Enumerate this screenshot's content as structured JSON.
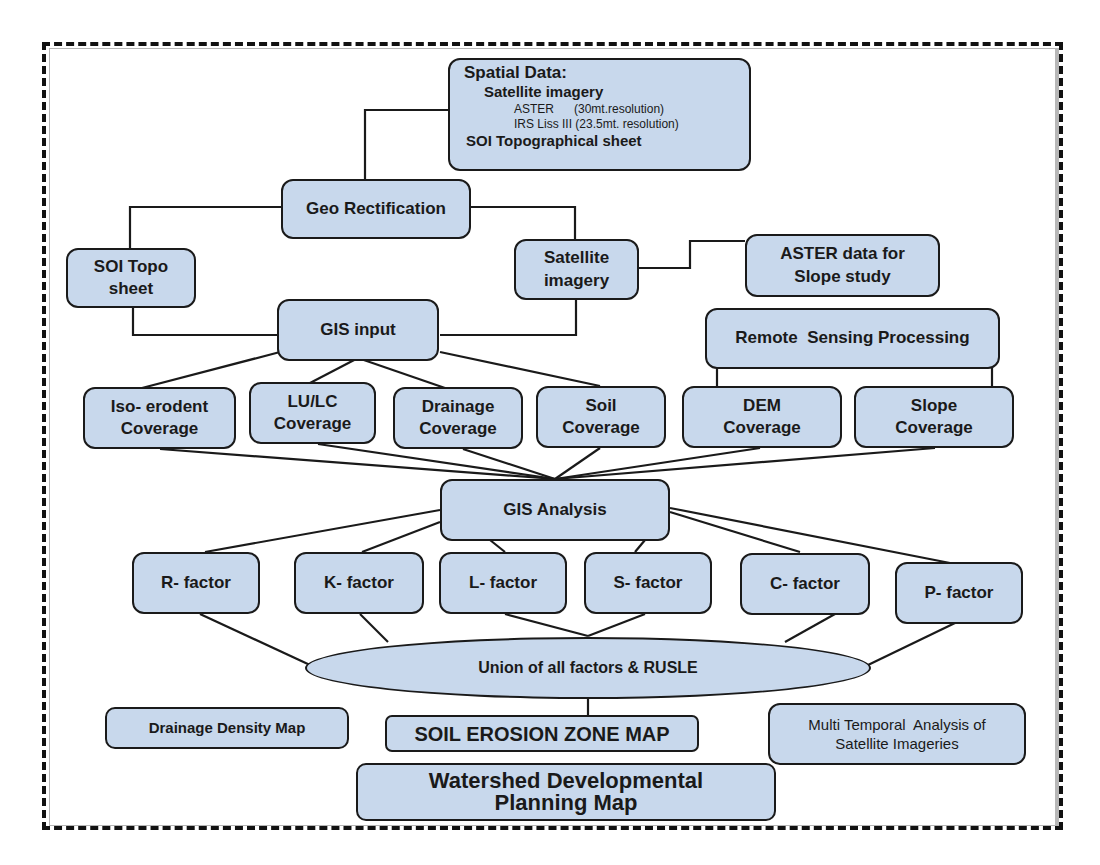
{
  "colors": {
    "box_fill": "#c8d8ec",
    "box_stroke": "#1a1a1a",
    "connector": "#1a1a1a",
    "frame_dash": "#111111"
  },
  "nodes": {
    "spatial_data": {
      "title": "Spatial Data:",
      "subtitle": "Satellite imagery",
      "aster": "ASTER      (30mt.resolution)",
      "irs": "IRS Liss III (23.5mt. resolution)",
      "soi": "SOI Topographical sheet"
    },
    "geo_rectification": {
      "label": "Geo Rectification"
    },
    "soi_topo_sheet": {
      "line1": "SOI Topo",
      "line2": "sheet"
    },
    "satellite_imagery": {
      "line1": "Satellite",
      "line2": "imagery"
    },
    "aster_slope": {
      "line1": "ASTER data for",
      "line2": "Slope study"
    },
    "gis_input": {
      "label": "GIS input"
    },
    "remote_sensing": {
      "label": "Remote  Sensing Processing"
    },
    "coverages": [
      {
        "line1": "Iso- erodent",
        "line2": "Coverage"
      },
      {
        "line1": "LU/LC",
        "line2": "Coverage"
      },
      {
        "line1": "Drainage",
        "line2": "Coverage"
      },
      {
        "line1": "Soil",
        "line2": "Coverage"
      },
      {
        "line1": "DEM",
        "line2": "Coverage"
      },
      {
        "line1": "Slope",
        "line2": "Coverage"
      }
    ],
    "gis_analysis": {
      "label": "GIS Analysis"
    },
    "factors": [
      {
        "label": "R- factor"
      },
      {
        "label": "K- factor"
      },
      {
        "label": "L- factor"
      },
      {
        "label": "S- factor"
      },
      {
        "label": "C- factor"
      },
      {
        "label": "P- factor"
      }
    ],
    "union": {
      "label": "Union of all factors & RUSLE"
    },
    "drainage_density": {
      "label": "Drainage Density Map"
    },
    "soil_erosion": {
      "label": "SOIL EROSION ZONE MAP"
    },
    "multi_temporal": {
      "line1": "Multi Temporal  Analysis of",
      "line2": "Satellite Imageries"
    },
    "watershed": {
      "line1": "Watershed Developmental",
      "line2": "Planning Map"
    }
  },
  "edges": [
    [
      "spatial_data",
      "geo_rectification"
    ],
    [
      "geo_rectification",
      "soi_topo_sheet"
    ],
    [
      "geo_rectification",
      "satellite_imagery"
    ],
    [
      "satellite_imagery",
      "aster_slope"
    ],
    [
      "soi_topo_sheet",
      "gis_input"
    ],
    [
      "satellite_imagery",
      "gis_input"
    ],
    [
      "gis_input",
      "iso_erodent_coverage"
    ],
    [
      "gis_input",
      "lulc_coverage"
    ],
    [
      "gis_input",
      "drainage_coverage"
    ],
    [
      "gis_input",
      "soil_coverage"
    ],
    [
      "remote_sensing",
      "dem_coverage"
    ],
    [
      "remote_sensing",
      "slope_coverage"
    ],
    [
      "all_coverages",
      "gis_analysis"
    ],
    [
      "gis_analysis",
      "all_factors"
    ],
    [
      "all_factors",
      "union"
    ],
    [
      "union",
      "soil_erosion"
    ]
  ]
}
